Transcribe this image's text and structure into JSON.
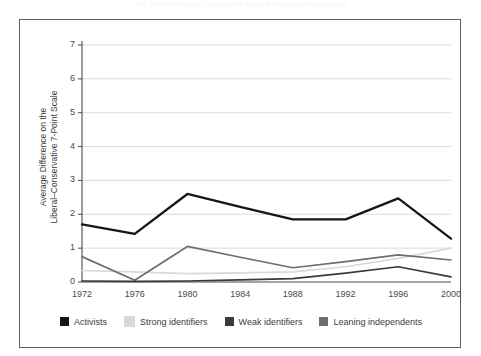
{
  "figure": {
    "caption": "The 7-Point Liberal-Conservative Scale by Partisan Involvement"
  },
  "chart_data": {
    "type": "line",
    "title": "",
    "xlabel": "",
    "ylabel": "Average  Difference on the\nLiberal–Conservative 7-Point Scale",
    "categories": [
      "1972",
      "1976",
      "1980",
      "1984",
      "1988",
      "1992",
      "1996",
      "2000"
    ],
    "x": [
      1972,
      1976,
      1980,
      1984,
      1988,
      1992,
      1996,
      2000
    ],
    "xlim": [
      1972,
      2000
    ],
    "ylim": [
      0,
      7
    ],
    "yticks": [
      "0",
      "1",
      "2",
      "3",
      "4",
      "5",
      "6",
      "7"
    ],
    "grid": "horizontal",
    "legend_position": "bottom",
    "series": [
      {
        "name": "Activists",
        "color": "#161616",
        "width": 2.3,
        "values": [
          1.7,
          1.42,
          2.6,
          2.22,
          1.85,
          1.85,
          2.47,
          1.28
        ]
      },
      {
        "name": "Strong identifiers",
        "color": "#d9d9d9",
        "width": 1.7,
        "values": [
          0.34,
          0.3,
          0.25,
          0.27,
          0.3,
          0.45,
          0.7,
          1.0
        ]
      },
      {
        "name": "Weak identifiers",
        "color": "#3a3a3a",
        "width": 1.7,
        "values": [
          0.03,
          0.02,
          0.03,
          0.06,
          0.1,
          0.26,
          0.45,
          0.15
        ]
      },
      {
        "name": "Leaning independents",
        "color": "#6e6e6e",
        "width": 1.7,
        "values": [
          0.75,
          0.05,
          1.05,
          0.73,
          0.42,
          0.6,
          0.8,
          0.65
        ]
      }
    ]
  },
  "legend": {
    "items": [
      {
        "label": "Activists",
        "color": "#161616"
      },
      {
        "label": "Strong identifiers",
        "color": "#d9d9d9"
      },
      {
        "label": "Weak identifiers",
        "color": "#3a3a3a"
      },
      {
        "label": "Leaning independents",
        "color": "#6e6e6e"
      }
    ]
  }
}
